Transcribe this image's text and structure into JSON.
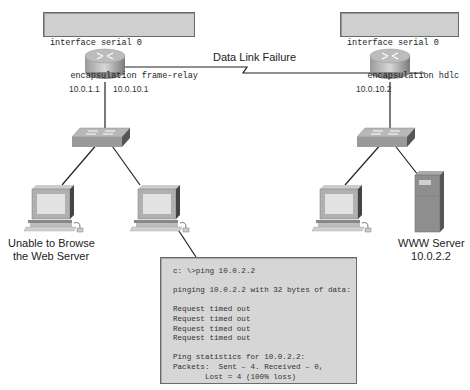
{
  "diagram": {
    "title": "Data Link Failure",
    "left_router": {
      "config": [
        "interface serial 0",
        "    encapsulation frame-relay"
      ],
      "ip_lan": "10.0.1.1",
      "ip_wan": "10.0.10.1"
    },
    "right_router": {
      "config": [
        "interface serial 0",
        "    encapsulation hdlc"
      ],
      "ip_wan": "10.0.10.2"
    },
    "left_host_label": [
      "Unable to Browse",
      "the Web Server"
    ],
    "server_label": [
      "WWW Server",
      "10.0.2.2"
    ],
    "terminal": {
      "command": "c: \\>ping 10.0.2.2",
      "pinging": "pinging 10.0.2.2 with 32 bytes of data:",
      "replies": [
        "Request timed out",
        "Request timed out",
        "Request timed out",
        "Request timed out"
      ],
      "stats_header": "Ping statistics for 10.0.2.2:",
      "stats_line1": "Packets:  Sent – 4. Received – 0,",
      "stats_line2": "       Lost = 4 (100% loss)"
    },
    "colors": {
      "box_fill": "#cfcfcf",
      "terminal_fill": "#d6d6d6",
      "line": "#222222"
    }
  }
}
